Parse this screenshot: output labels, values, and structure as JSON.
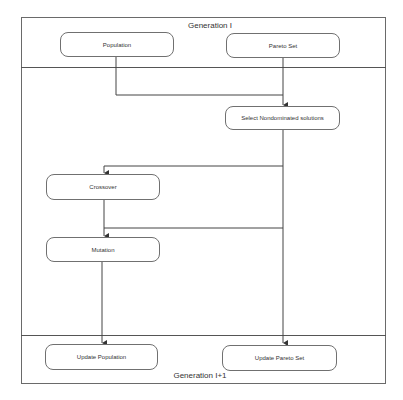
{
  "diagram": {
    "top_section": {
      "title": "Generation I"
    },
    "bottom_section": {
      "title": "Generation I+1"
    },
    "nodes": {
      "population": "Population",
      "pareto_set": "Pareto Set",
      "select": "Select Nondominated solutions",
      "crossover": "Crossover",
      "mutation": "Mutation",
      "update_population": "Update Population",
      "update_pareto_set": "Update Pareto Set"
    },
    "edges": [
      {
        "from": "population",
        "to": "select"
      },
      {
        "from": "pareto_set",
        "to": "select"
      },
      {
        "from": "select",
        "to": "crossover"
      },
      {
        "from": "crossover",
        "to": "mutation"
      },
      {
        "from": "select",
        "to": "mutation"
      },
      {
        "from": "mutation",
        "to": "update_population"
      },
      {
        "from": "select",
        "to": "update_pareto_set"
      }
    ]
  }
}
